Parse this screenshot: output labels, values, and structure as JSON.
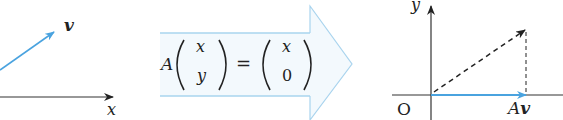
{
  "left_panel": {
    "vector_label": "v",
    "x_axis_label": "x"
  },
  "arrow_equation": {
    "matrix": "A",
    "input_vector": [
      "x",
      "y"
    ],
    "equals": "=",
    "output_vector": [
      "x",
      "0"
    ]
  },
  "right_panel": {
    "y_axis_label": "y",
    "origin_label": "O",
    "result_label_A": "A",
    "result_label_v": "v"
  },
  "colors": {
    "vector_blue": "#4aa3df",
    "arrow_fill": "#eef7fc",
    "arrow_stroke": "#a9d4ee",
    "axis": "#333333"
  }
}
